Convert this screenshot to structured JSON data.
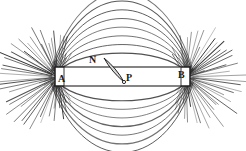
{
  "figure": {
    "background_color": "#ffffff",
    "line_color": "#2b2b2b",
    "magnet": {
      "name": "bar-magnet",
      "pole_left_label": "A",
      "pole_right_label": "B",
      "x": 55,
      "y": 67,
      "width": 135,
      "height": 19,
      "fill_color": "#ffffff",
      "stroke_color": "#1f1f1f"
    },
    "compass_needle": {
      "name": "compass-needle",
      "north_label": "N",
      "pivot_label": "P",
      "north_x": 104,
      "north_y": 58,
      "pivot_x": 124,
      "pivot_y": 82,
      "fill_color": "#d8d8d8",
      "stroke_color": "#1f1f1f"
    },
    "labels": [
      {
        "name": "pole-label-a",
        "text": "A",
        "x": 58,
        "y": 74
      },
      {
        "name": "pole-label-b",
        "text": "B",
        "x": 178,
        "y": 70
      },
      {
        "name": "needle-north-label",
        "text": "N",
        "x": 89,
        "y": 55
      },
      {
        "name": "needle-pivot-label",
        "text": "P",
        "x": 126,
        "y": 73
      }
    ]
  },
  "chart_data": {
    "type": "diagram",
    "xlabel": "",
    "ylabel": "",
    "poles": [
      {
        "label": "A",
        "x": 58,
        "y": 77,
        "role": "left-pole"
      },
      {
        "label": "B",
        "x": 186,
        "y": 77,
        "role": "right-pole"
      }
    ],
    "annotations": [
      "A",
      "B",
      "N",
      "P"
    ],
    "upper_arc_count": 8,
    "lower_arc_count": 7,
    "spray_ray_count_per_pole": 46,
    "legend": "none",
    "grid": false
  }
}
